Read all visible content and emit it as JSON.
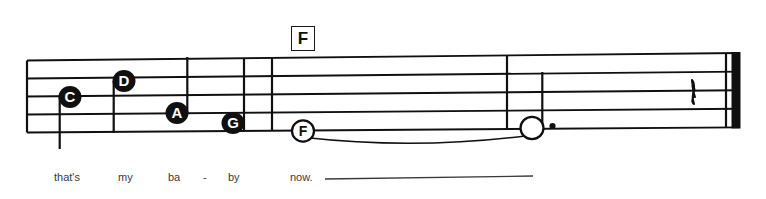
{
  "document": {
    "kind": "music-notation-excerpt",
    "staff_lines": 5,
    "ink_color": "#101010",
    "paper_color": "#ffffff",
    "lyric_color": "#3a3a3a"
  },
  "chord_symbols": [
    {
      "label": "F",
      "x": 291,
      "y": 26,
      "w": 24,
      "h": 25,
      "font_size": 17
    }
  ],
  "notes": [
    {
      "letter": "C",
      "head": "filled",
      "stem": "down",
      "cx": 70,
      "cy": 97,
      "r": 11.5,
      "font_size": 15,
      "measure": 1
    },
    {
      "letter": "D",
      "head": "filled",
      "stem": "down",
      "cx": 124,
      "cy": 81,
      "r": 11.5,
      "font_size": 15,
      "measure": 1
    },
    {
      "letter": "A",
      "head": "filled",
      "stem": "up",
      "cx": 177,
      "cy": 113,
      "r": 11.5,
      "font_size": 15,
      "measure": 1
    },
    {
      "letter": "G",
      "head": "filled",
      "stem": "none",
      "cx": 233,
      "cy": 123,
      "r": 11.5,
      "font_size": 15,
      "measure": 1
    },
    {
      "letter": "F",
      "head": "open",
      "stem": "none",
      "cx": 303,
      "cy": 131,
      "r": 11.0,
      "font_size": 14,
      "measure": 2
    },
    {
      "letter": "",
      "head": "open",
      "stem": "up",
      "cx": 532,
      "cy": 128,
      "r": 11.5,
      "font_size": 0,
      "measure": 3,
      "dotted": true
    }
  ],
  "rests": [
    {
      "type": "quarter-rest",
      "x": 690,
      "y": 80
    }
  ],
  "barlines": [
    {
      "x": 27,
      "type": "single"
    },
    {
      "x": 244,
      "type": "single"
    },
    {
      "x": 272,
      "type": "single"
    },
    {
      "x": 507,
      "type": "single"
    },
    {
      "x": 726,
      "type": "final"
    }
  ],
  "ties": [
    {
      "from_x": 305,
      "to_x": 525,
      "label": "tie-f-to-dotted-half"
    }
  ],
  "lyrics": [
    {
      "syllable": "that's",
      "x": 54,
      "y": 172
    },
    {
      "syllable": "my",
      "x": 118,
      "y": 172
    },
    {
      "syllable": "ba",
      "x": 168,
      "y": 172
    },
    {
      "syllable": "-",
      "x": 203,
      "y": 172
    },
    {
      "syllable": "by",
      "x": 228,
      "y": 172
    },
    {
      "syllable": "now.",
      "x": 290,
      "y": 172
    }
  ],
  "melisma_line": {
    "x1": 325,
    "y1": 179,
    "x2": 533,
    "y2": 176
  }
}
